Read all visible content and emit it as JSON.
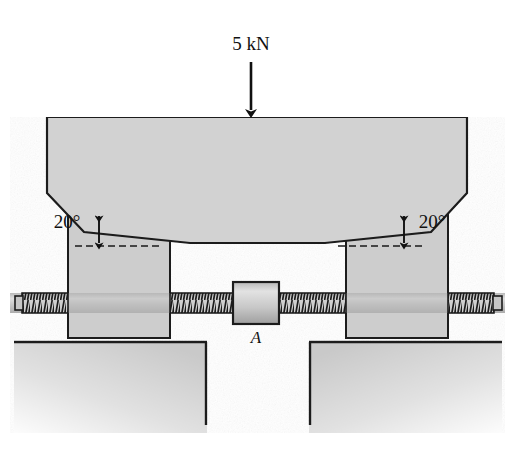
{
  "figure": {
    "type": "engineering-diagram",
    "background_color": "#ffffff",
    "fill_color": "#d2d2d2",
    "fill_color_dark": "#c2c2c2",
    "outline_color": "#1a1a1a"
  },
  "labels": {
    "load": "5 kN",
    "angle_left": "20°",
    "angle_right": "20°",
    "point_a": "A"
  },
  "annotations": {
    "load_arrow": {
      "name": "load-arrow",
      "direction": "down",
      "x": 251,
      "y_start": 62,
      "y_end": 116
    },
    "angle_left_arrow": {
      "name": "angle-dimension-arrow-left",
      "x": 99,
      "y_top": 213,
      "y_bottom": 245
    },
    "angle_right_arrow": {
      "name": "angle-dimension-arrow-right",
      "x": 400,
      "y_top": 213,
      "y_bottom": 245
    },
    "datum_left": {
      "name": "datum-line-left",
      "x1": 75,
      "x2": 160,
      "y": 246
    },
    "datum_right": {
      "name": "datum-line-right",
      "x1": 340,
      "x2": 425,
      "y": 246
    }
  },
  "parts": [
    {
      "name": "upper-wedge-block",
      "description": "top loaded block with V shaped underside"
    },
    {
      "name": "left-jaw-block",
      "description": "left sliding jaw with inclined top face"
    },
    {
      "name": "right-jaw-block",
      "description": "right sliding jaw with inclined top face"
    },
    {
      "name": "left-ground-support",
      "description": "left fixed foundation"
    },
    {
      "name": "right-ground-support",
      "description": "right fixed foundation"
    },
    {
      "name": "screw-shaft",
      "description": "horizontal threaded screw through both jaws"
    },
    {
      "name": "collar-a",
      "description": "central collar labelled A"
    }
  ],
  "geometry": {
    "upper_block": {
      "points": "47,117 467,117 467,193 431,232 325,243 190,243 84,232 47,193"
    },
    "left_jaw": {
      "points": "68,194 170,239 170,338 68,338"
    },
    "right_jaw": {
      "points": "346,239 448,194 448,338 346,338"
    },
    "left_ground": {
      "points": "14,341 207,341 207,430 14,430"
    },
    "right_ground": {
      "points": "309,341 502,341 502,430 309,430"
    },
    "screw": {
      "y_center": 303,
      "half_height": 10,
      "x_left": 10,
      "x_right": 505
    },
    "collar": {
      "x": 233,
      "y": 282,
      "w": 46,
      "h": 42
    }
  },
  "thread_segments": [
    {
      "name": "thread-far-left",
      "x1": 22,
      "x2": 68
    },
    {
      "name": "thread-left-inner",
      "x1": 170,
      "x2": 233
    },
    {
      "name": "thread-right-inner",
      "x1": 279,
      "x2": 346
    },
    {
      "name": "thread-far-right",
      "x1": 448,
      "x2": 494
    }
  ]
}
